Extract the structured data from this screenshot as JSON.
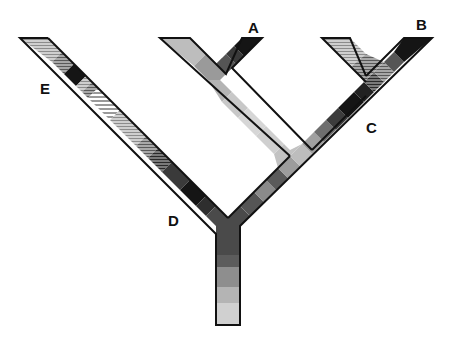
{
  "diagram": {
    "type": "phylogenetic-tree",
    "labels": {
      "A": "A",
      "B": "B",
      "C": "C",
      "D": "D",
      "E": "E"
    },
    "palette": {
      "outline": "#111111",
      "black": "#151515",
      "dark": "#3a3a3a",
      "mid_dark": "#5a5a5a",
      "mid": "#7d7d7d",
      "mid_light": "#9b9b9b",
      "light": "#b5b5b5",
      "lighter": "#c9c9c9",
      "lightest": "#d8d8d8",
      "hatch_light": "#bdbdbd",
      "hatch_dark": "#8a8a8a"
    }
  }
}
